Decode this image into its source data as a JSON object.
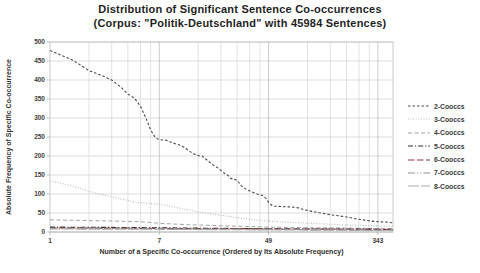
{
  "chart_data": {
    "type": "line",
    "title": "Distribution of Significant Sentence Co-occurrences",
    "subtitle": "(Corpus: \"Politik-Deutschland\"  with 45984 Sentences)",
    "xlabel": "Number of a Specific Co-occurrence (Ordered by Its Absolute Frequency)",
    "ylabel": "Absolute Frequency of Specific Co-occurrence",
    "x_scale": "log-base-7",
    "xlim": [
      1,
      449
    ],
    "ylim": [
      0,
      500
    ],
    "grid": true,
    "legend_position": "right",
    "x_ticks": [
      1,
      7,
      49,
      343
    ],
    "x_minor_gridlines": [
      2,
      3,
      4,
      5,
      6,
      7,
      14,
      21,
      28,
      35,
      42,
      49,
      98,
      147,
      196,
      245,
      294,
      343
    ],
    "y_ticks": [
      0,
      50,
      100,
      150,
      200,
      250,
      300,
      350,
      400,
      450,
      500
    ],
    "colors": {
      "grid_minor": "#d6d6d6",
      "grid_major": "#b5b5b5",
      "axis": "#a8a8a8",
      "border": "#bdbdbd",
      "title_text": "#1f1f1f"
    },
    "series": [
      {
        "name": "2-Cooccs",
        "color": "#4a4a4a",
        "dash": "2.5 2",
        "width": 1.1,
        "points": [
          [
            1,
            478
          ],
          [
            1.5,
            452
          ],
          [
            2,
            425
          ],
          [
            2.5,
            412
          ],
          [
            3,
            400
          ],
          [
            3.5,
            382
          ],
          [
            4,
            363
          ],
          [
            4.5,
            352
          ],
          [
            5,
            331
          ],
          [
            5.5,
            301
          ],
          [
            6,
            269
          ],
          [
            6.5,
            249
          ],
          [
            7,
            243
          ],
          [
            8,
            241
          ],
          [
            9,
            234
          ],
          [
            10,
            229
          ],
          [
            11,
            222
          ],
          [
            12,
            212
          ],
          [
            13,
            205
          ],
          [
            14,
            201
          ],
          [
            15,
            200
          ],
          [
            16,
            192
          ],
          [
            18,
            178
          ],
          [
            20,
            168
          ],
          [
            22,
            156
          ],
          [
            24,
            148
          ],
          [
            25,
            141
          ],
          [
            27,
            138
          ],
          [
            28,
            136
          ],
          [
            30,
            122
          ],
          [
            33,
            112
          ],
          [
            36,
            106
          ],
          [
            40,
            100
          ],
          [
            44,
            96
          ],
          [
            47,
            88
          ],
          [
            49,
            78
          ],
          [
            52,
            70
          ],
          [
            55,
            68
          ],
          [
            62,
            67
          ],
          [
            70,
            66
          ],
          [
            80,
            65
          ],
          [
            90,
            60
          ],
          [
            100,
            56
          ],
          [
            115,
            52
          ],
          [
            130,
            49
          ],
          [
            150,
            45
          ],
          [
            175,
            42
          ],
          [
            200,
            39
          ],
          [
            230,
            35
          ],
          [
            260,
            32
          ],
          [
            300,
            29
          ],
          [
            343,
            27
          ],
          [
            400,
            26
          ],
          [
            449,
            24
          ]
        ]
      },
      {
        "name": "3-Cooccs",
        "color": "#b9b9b9",
        "dash": "0.9 1.7",
        "width": 1.2,
        "points": [
          [
            1,
            135
          ],
          [
            1.5,
            121
          ],
          [
            2,
            107
          ],
          [
            2.5,
            99
          ],
          [
            3,
            93
          ],
          [
            3.5,
            87
          ],
          [
            4,
            83
          ],
          [
            4.5,
            79
          ],
          [
            5,
            77
          ],
          [
            6,
            75
          ],
          [
            7,
            73
          ],
          [
            8,
            70
          ],
          [
            9,
            66
          ],
          [
            10,
            63
          ],
          [
            12,
            58
          ],
          [
            14,
            53
          ],
          [
            16,
            50
          ],
          [
            20,
            45
          ],
          [
            24,
            41
          ],
          [
            28,
            38
          ],
          [
            34,
            34
          ],
          [
            40,
            31
          ],
          [
            49,
            29
          ],
          [
            60,
            27
          ],
          [
            75,
            25
          ],
          [
            90,
            24
          ],
          [
            110,
            22
          ],
          [
            140,
            21
          ],
          [
            180,
            19
          ],
          [
            230,
            18
          ],
          [
            300,
            17
          ],
          [
            343,
            16
          ],
          [
            449,
            15
          ]
        ]
      },
      {
        "name": "4-Cooccs",
        "color": "#a3a3a3",
        "dash": "4 2.5",
        "width": 1,
        "points": [
          [
            1,
            32
          ],
          [
            2,
            30
          ],
          [
            3,
            29
          ],
          [
            4,
            28
          ],
          [
            5,
            27
          ],
          [
            6,
            25
          ],
          [
            7,
            23
          ],
          [
            9,
            21
          ],
          [
            12,
            19
          ],
          [
            16,
            18
          ],
          [
            22,
            16
          ],
          [
            30,
            15
          ],
          [
            49,
            13
          ],
          [
            70,
            12
          ],
          [
            100,
            11
          ],
          [
            150,
            11
          ],
          [
            220,
            10
          ],
          [
            343,
            9
          ],
          [
            449,
            9
          ]
        ]
      },
      {
        "name": "5-Cooccs",
        "color": "#2e2e2e",
        "dash": "5 2 1.2 2",
        "width": 1.1,
        "points": [
          [
            1,
            13
          ],
          [
            3,
            12
          ],
          [
            7,
            11
          ],
          [
            15,
            10
          ],
          [
            35,
            9
          ],
          [
            80,
            8
          ],
          [
            200,
            8
          ],
          [
            449,
            7
          ]
        ]
      },
      {
        "name": "6-Cooccs",
        "color": "#7a3b3b",
        "dash": "6.5 2.5",
        "width": 1.2,
        "points": [
          [
            1,
            11
          ],
          [
            4,
            10
          ],
          [
            10,
            9
          ],
          [
            30,
            9
          ],
          [
            80,
            8
          ],
          [
            250,
            7
          ],
          [
            449,
            6
          ]
        ]
      },
      {
        "name": "7-Cooccs",
        "color": "#8f8f8f",
        "dash": "7 2 1.2 2 1.2 2",
        "width": 1.1,
        "points": [
          [
            1,
            10
          ],
          [
            5,
            9
          ],
          [
            15,
            8
          ],
          [
            49,
            7
          ],
          [
            150,
            6
          ],
          [
            449,
            5
          ]
        ]
      },
      {
        "name": "8-Cooccs",
        "color": "#ababab",
        "dash": "11 2",
        "width": 1.1,
        "points": [
          [
            1,
            8
          ],
          [
            6,
            7
          ],
          [
            20,
            6
          ],
          [
            100,
            5
          ],
          [
            343,
            4
          ],
          [
            449,
            4
          ]
        ]
      }
    ]
  }
}
